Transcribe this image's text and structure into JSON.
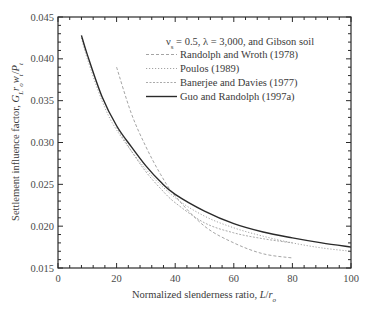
{
  "chart_data": {
    "type": "line",
    "title": "",
    "annotation": "ν_s = 0.5, λ = 3,000, and Gibson soil",
    "xlabel": "Normalized slenderness ratio, L/r_o",
    "ylabel": "Settlement influence factor, G_L r_o w_t / P_t",
    "xlim": [
      0,
      100
    ],
    "ylim": [
      0.015,
      0.045
    ],
    "x_ticks": [
      0,
      20,
      40,
      60,
      80,
      100
    ],
    "x_tick_labels": [
      "0",
      "20",
      "40",
      "60",
      "80",
      "100"
    ],
    "y_ticks": [
      0.015,
      0.02,
      0.025,
      0.03,
      0.035,
      0.04,
      0.045
    ],
    "y_tick_labels": [
      "0.015",
      "0.020",
      "0.025",
      "0.030",
      "0.035",
      "0.040",
      "0.045"
    ],
    "grid": false,
    "legend_position": "upper right (inside)",
    "series": [
      {
        "name": "Randolph and Wroth (1978)",
        "style": "dashed",
        "color": "#9a9a9a",
        "x": [
          20,
          25,
          30,
          35,
          40,
          50,
          60,
          70,
          80
        ],
        "y": [
          0.039,
          0.0335,
          0.0295,
          0.0262,
          0.0236,
          0.02,
          0.018,
          0.0167,
          0.0162
        ]
      },
      {
        "name": "Poulos (1989)",
        "style": "dotted",
        "color": "#9a9a9a",
        "x": [
          8,
          10,
          15,
          20,
          30,
          40,
          50,
          60,
          70,
          80,
          90,
          100
        ],
        "y": [
          0.0425,
          0.04,
          0.035,
          0.0315,
          0.0268,
          0.0234,
          0.0212,
          0.0198,
          0.0188,
          0.018,
          0.0174,
          0.017
        ]
      },
      {
        "name": "Banerjee and Davies (1977)",
        "style": "dash-dot-fine",
        "color": "#a0a0a0",
        "x": [
          20,
          25,
          30,
          35,
          40,
          50,
          60,
          70,
          80
        ],
        "y": [
          0.0318,
          0.029,
          0.0265,
          0.0245,
          0.0228,
          0.0204,
          0.0192,
          0.0185,
          0.018
        ]
      },
      {
        "name": "Guo and Randolph (1997a)",
        "style": "solid",
        "color": "#2a2a2a",
        "x": [
          8,
          10,
          15,
          20,
          25,
          30,
          35,
          40,
          50,
          60,
          70,
          80,
          90,
          100
        ],
        "y": [
          0.0428,
          0.0405,
          0.0355,
          0.032,
          0.0295,
          0.0272,
          0.0253,
          0.0238,
          0.0218,
          0.0203,
          0.0193,
          0.0186,
          0.018,
          0.0175
        ]
      }
    ]
  },
  "labels": {
    "annotation": "ν",
    "annotation_sub": "s",
    "annotation_rest": " = 0.5, λ = 3,000, and Gibson soil",
    "xlabel_main": "Normalized slenderness ratio, ",
    "xlabel_var": "L",
    "xlabel_slash": "/",
    "xlabel_r": "r",
    "xlabel_sub": "o",
    "ylabel_main": "Settlement influence factor, ",
    "ylabel_var": "G",
    "ylabel_sub1": "L",
    "ylabel_r": "r",
    "ylabel_sub2": "o",
    "ylabel_w": "w",
    "ylabel_sub3": "t",
    "ylabel_slash": "/",
    "ylabel_P": "P",
    "ylabel_sub4": "t"
  }
}
